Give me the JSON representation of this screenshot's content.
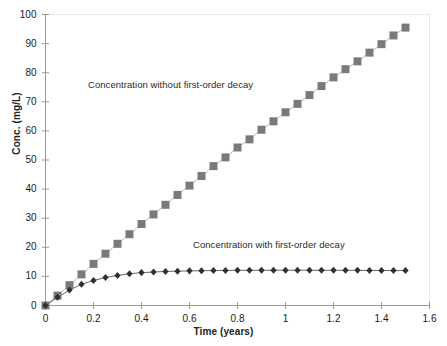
{
  "chart_data": {
    "type": "scatter",
    "title": "",
    "xlabel": "Time (years)",
    "ylabel": "Conc. (mg/L)",
    "xlim": [
      0,
      1.6
    ],
    "ylim": [
      0,
      100
    ],
    "xticks": [
      "0",
      "0.2",
      "0.4",
      "0.6",
      "0.8",
      "1",
      "1.2",
      "1.4",
      "1.6"
    ],
    "xtick_values": [
      0,
      0.2,
      0.4,
      0.6,
      0.8,
      1,
      1.2,
      1.4,
      1.6
    ],
    "yticks": [
      "0",
      "10",
      "20",
      "30",
      "40",
      "50",
      "60",
      "70",
      "80",
      "90",
      "100"
    ],
    "ytick_values": [
      0,
      10,
      20,
      30,
      40,
      50,
      60,
      70,
      80,
      90,
      100
    ],
    "grid": false,
    "legend_position": "inline-annotation",
    "annotations": [
      {
        "name": "label-without-decay",
        "text": "Concentration without first-order decay",
        "x": 0.3,
        "y": 74
      },
      {
        "name": "label-with-decay",
        "text": "Concentration with first-order decay",
        "x": 0.74,
        "y": 19.5
      }
    ],
    "x": [
      0,
      0.05,
      0.1,
      0.15,
      0.2,
      0.25,
      0.3,
      0.35,
      0.4,
      0.45,
      0.5,
      0.55,
      0.6,
      0.65,
      0.7,
      0.75,
      0.8,
      0.85,
      0.9,
      0.95,
      1.0,
      1.05,
      1.1,
      1.15,
      1.2,
      1.25,
      1.3,
      1.35,
      1.4,
      1.45,
      1.5
    ],
    "series": [
      {
        "name": "Concentration without first-order decay",
        "marker": "square",
        "color": "#7a7a7a",
        "line_color": "#b0b0b0",
        "marker_size": 4,
        "values": [
          0,
          3.4,
          7.0,
          10.7,
          14.3,
          17.8,
          21.2,
          24.5,
          28.0,
          31.3,
          34.6,
          38.0,
          41.2,
          44.5,
          47.9,
          50.9,
          54.3,
          57.1,
          60.4,
          63.3,
          66.4,
          69.3,
          72.3,
          75.4,
          78.4,
          81.2,
          83.9,
          86.9,
          89.8,
          92.8,
          95.5
        ]
      },
      {
        "name": "Concentration with first-order decay",
        "marker": "diamond",
        "color": "#2f2f2f",
        "line_color": "#555555",
        "marker_size": 2.6,
        "values": [
          0,
          2.8,
          5.3,
          7.3,
          8.6,
          9.6,
          10.3,
          10.9,
          11.3,
          11.5,
          11.7,
          11.8,
          11.9,
          11.95,
          12.0,
          12.05,
          12.08,
          12.1,
          12.1,
          12.12,
          12.12,
          12.12,
          12.12,
          12.1,
          12.1,
          12.1,
          12.08,
          12.05,
          12.03,
          12.0,
          12.0
        ]
      }
    ]
  },
  "axes": {
    "y_title": "Conc. (mg/L)",
    "x_title": "Time (years)"
  }
}
